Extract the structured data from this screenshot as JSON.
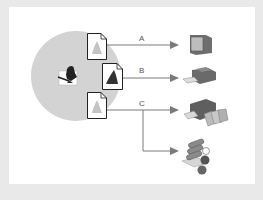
{
  "diagram": {
    "source": {
      "icon": "pen-hand-icon",
      "region_color": "#d3d3d3"
    },
    "documents": [
      {
        "id": "doc-a",
        "icon": "document-light-ink-icon",
        "ink_color": "#bdbdbd"
      },
      {
        "id": "doc-b",
        "icon": "document-dark-ink-icon",
        "ink_color": "#3a3a3a"
      },
      {
        "id": "doc-c",
        "icon": "document-light-ink-icon",
        "ink_color": "#bdbdbd"
      }
    ],
    "routes": [
      {
        "label": "A",
        "from": "doc-a",
        "to": "monitor"
      },
      {
        "label": "B",
        "from": "doc-b",
        "to": "desktop-printer"
      },
      {
        "label": "C",
        "from": "doc-c",
        "to": [
          "commercial-printer",
          "offset-press"
        ]
      }
    ],
    "outputs": [
      {
        "id": "monitor",
        "icon": "monitor-icon"
      },
      {
        "id": "desktop-printer",
        "icon": "desktop-printer-icon"
      },
      {
        "id": "commercial-printer",
        "icon": "commercial-printer-icon"
      },
      {
        "id": "offset-press",
        "icon": "offset-press-icon"
      }
    ],
    "colors": {
      "frame": "#e9e9e9",
      "panel": "#ffffff",
      "arrow": "#7a7a7a",
      "device": "#6e6e6e"
    }
  }
}
